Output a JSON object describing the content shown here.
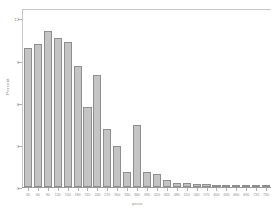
{
  "chart_data": {
    "type": "bar",
    "title": "",
    "subtitle": "",
    "xlabel": "price",
    "ylabel": "Percent",
    "grid": false,
    "legend": null,
    "ylim": [
      0,
      12.6
    ],
    "yticks": [
      0,
      3,
      6,
      9,
      12
    ],
    "ytick_labels": [
      "0",
      "3",
      "6",
      "9",
      "12"
    ],
    "xlim": [
      15,
      765
    ],
    "bin_width": 30,
    "categories": [
      "30",
      "60",
      "90",
      "120",
      "150",
      "180",
      "210",
      "240",
      "270",
      "300",
      "330",
      "360",
      "390",
      "420",
      "450",
      "480",
      "510",
      "540",
      "570",
      "600",
      "630",
      "660",
      "690",
      "720",
      "750"
    ],
    "xtick_labels": [
      "30",
      "60",
      "90",
      "120",
      "150",
      "180",
      "210",
      "240",
      "270",
      "300",
      "330",
      "360",
      "390",
      "420",
      "450",
      "480",
      "510",
      "540",
      "570",
      "600",
      "630",
      "660",
      "690",
      "720",
      "750"
    ],
    "values": [
      9.9,
      10.2,
      11.1,
      10.6,
      10.3,
      8.6,
      5.7,
      8.0,
      4.1,
      2.9,
      1.1,
      4.4,
      1.1,
      0.9,
      0.5,
      0.3,
      0.3,
      0.2,
      0.2,
      0.1,
      0.1,
      0.1,
      0.1,
      0.1,
      0.1
    ],
    "bars": [
      {
        "x": 30,
        "percent": 9.9
      },
      {
        "x": 60,
        "percent": 10.2
      },
      {
        "x": 90,
        "percent": 11.1
      },
      {
        "x": 120,
        "percent": 10.6
      },
      {
        "x": 150,
        "percent": 10.3
      },
      {
        "x": 180,
        "percent": 8.6
      },
      {
        "x": 210,
        "percent": 5.7
      },
      {
        "x": 240,
        "percent": 8.0
      },
      {
        "x": 270,
        "percent": 4.1
      },
      {
        "x": 300,
        "percent": 2.9
      },
      {
        "x": 330,
        "percent": 1.1
      },
      {
        "x": 360,
        "percent": 4.4
      },
      {
        "x": 390,
        "percent": 1.1
      },
      {
        "x": 420,
        "percent": 0.9
      },
      {
        "x": 450,
        "percent": 0.5
      },
      {
        "x": 480,
        "percent": 0.3
      },
      {
        "x": 510,
        "percent": 0.3
      },
      {
        "x": 540,
        "percent": 0.2
      },
      {
        "x": 570,
        "percent": 0.2
      },
      {
        "x": 600,
        "percent": 0.1
      },
      {
        "x": 630,
        "percent": 0.1
      },
      {
        "x": 660,
        "percent": 0.1
      },
      {
        "x": 690,
        "percent": 0.1
      },
      {
        "x": 720,
        "percent": 0.1
      },
      {
        "x": 750,
        "percent": 0.1
      }
    ],
    "colors": {
      "bar_fill": "#c4c4c4",
      "bar_edge": "#8e8e8e",
      "axis": "#9a9a9a",
      "text": "#8a8a8a",
      "background": "#ffffff"
    }
  }
}
